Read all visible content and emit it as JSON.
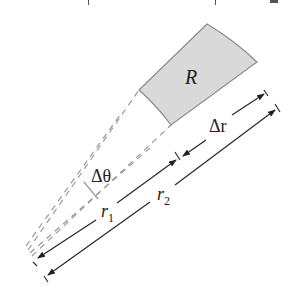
{
  "diagram": {
    "type": "polar-region-element",
    "region_label": "R",
    "labels": {
      "delta_r": "Δr",
      "delta_theta": "Δθ",
      "r1": "r",
      "r1_sub": "1",
      "r2": "r",
      "r2_sub": "2"
    },
    "colors": {
      "region_fill": "#d9d9d9",
      "region_stroke": "#8a8a8a",
      "dashed": "#9a9a9a",
      "arrow": "#222222"
    }
  }
}
